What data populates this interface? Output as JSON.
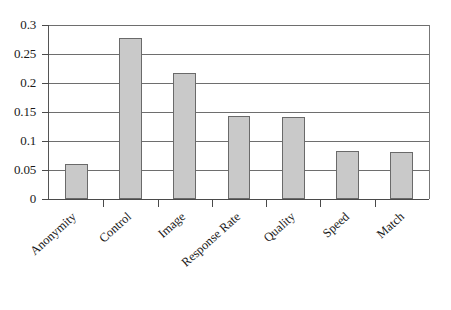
{
  "chart_data": {
    "type": "bar",
    "title": "",
    "xlabel": "",
    "ylabel": "",
    "categories": [
      "Anonymity",
      "Control",
      "Image",
      "Response Rate",
      "Quality",
      "Speed",
      "Match"
    ],
    "values": [
      0.061,
      0.278,
      0.218,
      0.143,
      0.142,
      0.082,
      0.081
    ],
    "ylim": [
      0,
      0.3
    ],
    "ytick_labels": [
      "0",
      "0.05",
      "0.1",
      "0.15",
      "0.2",
      "0.25",
      "0.3"
    ],
    "ytick_values": [
      0,
      0.05,
      0.1,
      0.15,
      0.2,
      0.25,
      0.3
    ],
    "grid": "horizontal",
    "legend": "none",
    "series": [
      {
        "name": "",
        "values": [
          0.061,
          0.278,
          0.218,
          0.143,
          0.142,
          0.082,
          0.081
        ]
      }
    ],
    "colors": {
      "bar_fill": "#c9c9c9",
      "bar_border": "#6a6a6a",
      "gridline": "#6e6e6e",
      "axis": "#4a4a4a",
      "background": "#ffffff",
      "text": "#1a1a1a"
    }
  }
}
